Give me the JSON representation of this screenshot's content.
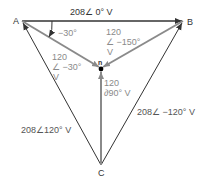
{
  "diagram": {
    "nodes": {
      "A": "A",
      "B": "B",
      "C": "C",
      "n": "n"
    },
    "line_voltages": {
      "AB": "208∠ 0° V",
      "CA": "208∠120° V",
      "BC": "208∠ −120° V"
    },
    "phase_voltages": {
      "An": {
        "magnitude": "120",
        "angle": "∠ −30°",
        "unit": "V"
      },
      "Bn": {
        "magnitude": "120",
        "angle": "∠ −150°",
        "unit": "V"
      },
      "Cn": {
        "magnitude": "120",
        "angle": "∂90° V"
      }
    },
    "angle_marker": "−30°",
    "colors": {
      "line": "#333333",
      "phase_line": "#8a8a8a",
      "node": "#000000"
    }
  }
}
